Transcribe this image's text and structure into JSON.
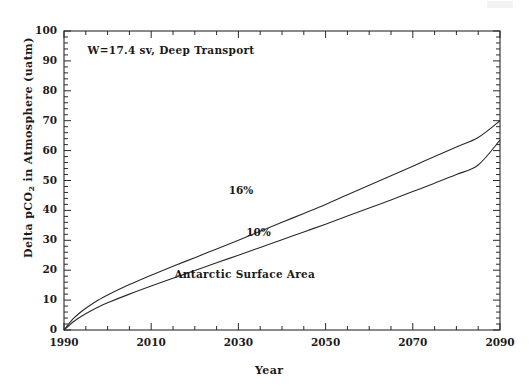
{
  "chart_data": {
    "type": "line",
    "title": "",
    "xlabel": "Year",
    "ylabel": "Delta pCO2 in Atmosphere (uatm)",
    "ylabel_parts": {
      "pre": "Delta pCO",
      "sub": "2",
      "post": " in Atmosphere (uatm)"
    },
    "xlim": [
      1990,
      2090
    ],
    "ylim": [
      0,
      100
    ],
    "xticks": [
      1990,
      2010,
      2030,
      2050,
      2070,
      2090
    ],
    "xtick_labels": [
      "1990",
      "2010",
      "2030",
      "2050",
      "2070",
      "2090"
    ],
    "xtick_minor_step": 5,
    "yticks": [
      0,
      10,
      20,
      30,
      40,
      50,
      60,
      70,
      80,
      90,
      100
    ],
    "ytick_labels": [
      "0",
      "10",
      "20",
      "30",
      "40",
      "50",
      "60",
      "70",
      "80",
      "90",
      "100"
    ],
    "ytick_minor_step": 2,
    "grid": false,
    "legend": "inline-labels",
    "line_color": "#2a2a2a",
    "annotations": [
      {
        "name": "transport-note",
        "text": "W=17.4 sv, Deep Transport",
        "x": 2000,
        "y": 93
      },
      {
        "name": "surface-area-note",
        "text": "Antarctic Surface Area",
        "x": 2030,
        "y": 18
      }
    ],
    "series": [
      {
        "name": "16%",
        "label": "16%",
        "label_x": 2031,
        "label_y": 46,
        "x": [
          1990,
          1992,
          1994,
          1996,
          1998,
          2000,
          2005,
          2010,
          2015,
          2020,
          2025,
          2030,
          2035,
          2040,
          2045,
          2050,
          2055,
          2060,
          2065,
          2070,
          2075,
          2080,
          2085,
          2090
        ],
        "values": [
          0,
          3.6,
          6.2,
          8.3,
          10.1,
          11.7,
          15.2,
          18.3,
          21.3,
          24.2,
          27.1,
          30.0,
          33.0,
          36.0,
          39.0,
          42.0,
          45.2,
          48.4,
          51.6,
          54.8,
          58.0,
          61.2,
          64.4,
          70.0
        ]
      },
      {
        "name": "10%",
        "label": "10%",
        "label_x": 2035,
        "label_y": 32,
        "x": [
          1990,
          1992,
          1994,
          1996,
          1998,
          2000,
          2005,
          2010,
          2015,
          2020,
          2025,
          2030,
          2035,
          2040,
          2045,
          2050,
          2055,
          2060,
          2065,
          2070,
          2075,
          2080,
          2085,
          2090
        ],
        "values": [
          0,
          2.6,
          4.6,
          6.3,
          7.8,
          9.1,
          12.0,
          14.7,
          17.3,
          19.9,
          22.5,
          25.0,
          27.6,
          30.2,
          32.8,
          35.4,
          38.1,
          40.8,
          43.5,
          46.3,
          49.1,
          52.0,
          55.2,
          63.5
        ]
      }
    ]
  }
}
